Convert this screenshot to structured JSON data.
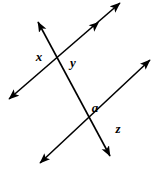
{
  "figure": {
    "kind": "geometry-diagram",
    "width": 152,
    "height": 170,
    "background_color": "#ffffff",
    "stroke_color": "#000000",
    "stroke_width": 1.6,
    "lines": [
      {
        "name": "transversal",
        "label": "transversal",
        "x1": 38,
        "y1": 22,
        "x2": 110,
        "y2": 156,
        "arrow_start": true,
        "arrow_end": true
      },
      {
        "name": "upper-parallel-line",
        "label": "line 1",
        "x1": 9,
        "y1": 99,
        "x2": 120,
        "y2": 3,
        "arrow_start": true,
        "arrow_end": true
      },
      {
        "name": "lower-parallel-line",
        "label": "line 2",
        "x1": 40,
        "y1": 163,
        "x2": 150,
        "y2": 60,
        "arrow_start": true,
        "arrow_end": true
      }
    ],
    "extra_arrowheads": [
      {
        "name": "upper-parallel-mid-arrowhead",
        "x": 99,
        "y": 22,
        "angle": -40.8
      }
    ],
    "intersections": [
      {
        "name": "intersection-upper",
        "x": 58,
        "y": 58
      },
      {
        "name": "intersection-lower",
        "x": 95,
        "y": 124
      }
    ],
    "labels": [
      {
        "name": "angle-label-x",
        "text": "x",
        "x": 39,
        "y": 56
      },
      {
        "name": "angle-label-y",
        "text": "y",
        "x": 73,
        "y": 62
      },
      {
        "name": "angle-label-a",
        "text": "a",
        "x": 95,
        "y": 107
      },
      {
        "name": "angle-label-z",
        "text": "z",
        "x": 118,
        "y": 128
      }
    ]
  }
}
